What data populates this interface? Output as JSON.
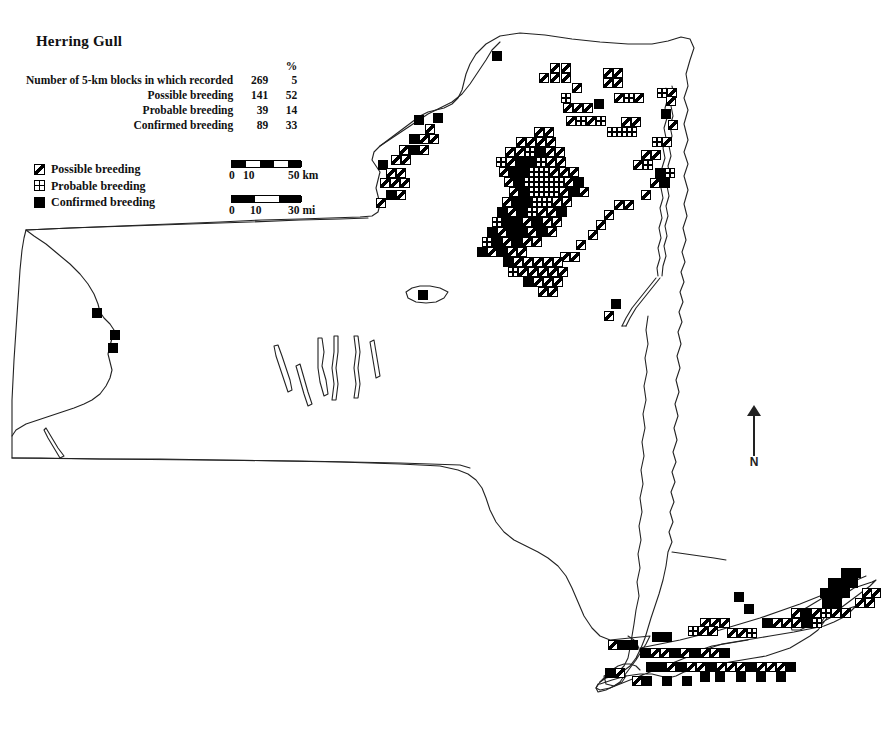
{
  "map": {
    "title": "Herring Gull",
    "region": "New York State",
    "stats": {
      "percent_header": "%",
      "rows": [
        {
          "label": "Number of 5-km blocks in which recorded",
          "count": "269",
          "percent": "5"
        },
        {
          "label": "Possible breeding",
          "count": "141",
          "percent": "52"
        },
        {
          "label": "Probable breeding",
          "count": "39",
          "percent": "14"
        },
        {
          "label": "Confirmed breeding",
          "count": "89",
          "percent": "33"
        }
      ]
    },
    "legend": [
      {
        "symbol": "possible-breeding-icon",
        "label": "Possible breeding"
      },
      {
        "symbol": "probable-breeding-icon",
        "label": "Probable breeding"
      },
      {
        "symbol": "confirmed-breeding-icon",
        "label": "Confirmed breeding"
      }
    ],
    "scales": [
      {
        "unit": "km",
        "start": "0",
        "mid": "10",
        "end": "50 km"
      },
      {
        "unit": "mi",
        "start": "0",
        "mid": "10",
        "end": "30 mi"
      }
    ],
    "compass": {
      "label": "N",
      "icon": "north-arrow-icon"
    },
    "colors": {
      "ink": "#000000",
      "paper": "#ffffff",
      "outline": "#222222"
    }
  },
  "chart_data": {
    "type": "map",
    "title": "Herring Gull",
    "subtitle": "Breeding distribution by 5-km block",
    "categories": [
      "Possible breeding",
      "Probable breeding",
      "Confirmed breeding"
    ],
    "values": [
      141,
      39,
      89
    ],
    "percents": [
      52,
      14,
      33
    ],
    "total_blocks_recorded": 269,
    "total_blocks_percent": 5,
    "legend_position": "upper-left",
    "grid": false,
    "block_size_px": 10,
    "symbols": {
      "possible": "square-with-diagonal",
      "probable": "square-with-cross",
      "confirmed": "solid-square"
    },
    "blocks": [
      [
        "c",
        492,
        51
      ],
      [
        "p",
        550,
        63
      ],
      [
        "p",
        561,
        63
      ],
      [
        "p",
        603,
        68
      ],
      [
        "p",
        613,
        68
      ],
      [
        "p",
        539,
        73
      ],
      [
        "p",
        550,
        73
      ],
      [
        "p",
        561,
        73
      ],
      [
        "p",
        603,
        78
      ],
      [
        "p",
        613,
        78
      ],
      [
        "r",
        657,
        88
      ],
      [
        "p",
        667,
        88
      ],
      [
        "p",
        572,
        83
      ],
      [
        "c",
        594,
        99
      ],
      [
        "p",
        666,
        96
      ],
      [
        "c",
        661,
        109
      ],
      [
        "p",
        668,
        120
      ],
      [
        "r",
        561,
        93
      ],
      [
        "p",
        614,
        93
      ],
      [
        "r",
        624,
        93
      ],
      [
        "p",
        634,
        93
      ],
      [
        "p",
        563,
        103
      ],
      [
        "p",
        573,
        103
      ],
      [
        "p",
        583,
        103
      ],
      [
        "p",
        621,
        117
      ],
      [
        "p",
        631,
        117
      ],
      [
        "p",
        566,
        116
      ],
      [
        "r",
        576,
        116
      ],
      [
        "p",
        586,
        116
      ],
      [
        "r",
        596,
        116
      ],
      [
        "p",
        534,
        127
      ],
      [
        "p",
        544,
        127
      ],
      [
        "r",
        607,
        127
      ],
      [
        "r",
        617,
        127
      ],
      [
        "r",
        627,
        127
      ],
      [
        "p",
        516,
        137
      ],
      [
        "p",
        526,
        137
      ],
      [
        "p",
        536,
        137
      ],
      [
        "p",
        546,
        137
      ],
      [
        "r",
        652,
        137
      ],
      [
        "p",
        662,
        137
      ],
      [
        "p",
        505,
        147
      ],
      [
        "p",
        515,
        147
      ],
      [
        "r",
        525,
        147
      ],
      [
        "c",
        535,
        147
      ],
      [
        "p",
        545,
        147
      ],
      [
        "p",
        555,
        147
      ],
      [
        "p",
        641,
        150
      ],
      [
        "p",
        651,
        150
      ],
      [
        "r",
        496,
        157
      ],
      [
        "p",
        506,
        157
      ],
      [
        "c",
        516,
        157
      ],
      [
        "c",
        526,
        157
      ],
      [
        "r",
        536,
        157
      ],
      [
        "p",
        546,
        157
      ],
      [
        "p",
        556,
        157
      ],
      [
        "p",
        633,
        160
      ],
      [
        "r",
        643,
        160
      ],
      [
        "p",
        499,
        167
      ],
      [
        "c",
        509,
        167
      ],
      [
        "c",
        519,
        167
      ],
      [
        "r",
        529,
        167
      ],
      [
        "r",
        539,
        167
      ],
      [
        "p",
        549,
        167
      ],
      [
        "p",
        559,
        167
      ],
      [
        "p",
        569,
        167
      ],
      [
        "c",
        655,
        168
      ],
      [
        "r",
        665,
        168
      ],
      [
        "p",
        504,
        177
      ],
      [
        "c",
        514,
        177
      ],
      [
        "r",
        524,
        177
      ],
      [
        "r",
        534,
        177
      ],
      [
        "r",
        544,
        177
      ],
      [
        "r",
        554,
        177
      ],
      [
        "p",
        564,
        177
      ],
      [
        "c",
        574,
        177
      ],
      [
        "p",
        650,
        178
      ],
      [
        "c",
        660,
        178
      ],
      [
        "p",
        509,
        187
      ],
      [
        "c",
        519,
        187
      ],
      [
        "r",
        529,
        187
      ],
      [
        "r",
        539,
        187
      ],
      [
        "r",
        549,
        187
      ],
      [
        "p",
        559,
        187
      ],
      [
        "c",
        569,
        187
      ],
      [
        "p",
        579,
        187
      ],
      [
        "p",
        641,
        190
      ],
      [
        "p",
        502,
        197
      ],
      [
        "c",
        512,
        197
      ],
      [
        "c",
        522,
        197
      ],
      [
        "r",
        532,
        197
      ],
      [
        "r",
        542,
        197
      ],
      [
        "p",
        552,
        197
      ],
      [
        "p",
        562,
        197
      ],
      [
        "p",
        614,
        200
      ],
      [
        "p",
        624,
        200
      ],
      [
        "c",
        497,
        207
      ],
      [
        "p",
        507,
        207
      ],
      [
        "c",
        517,
        207
      ],
      [
        "r",
        527,
        207
      ],
      [
        "p",
        537,
        207
      ],
      [
        "p",
        547,
        207
      ],
      [
        "c",
        557,
        207
      ],
      [
        "p",
        604,
        210
      ],
      [
        "r",
        492,
        217
      ],
      [
        "c",
        502,
        217
      ],
      [
        "c",
        512,
        217
      ],
      [
        "p",
        522,
        217
      ],
      [
        "c",
        532,
        217
      ],
      [
        "p",
        542,
        217
      ],
      [
        "p",
        552,
        217
      ],
      [
        "p",
        596,
        220
      ],
      [
        "c",
        487,
        227
      ],
      [
        "p",
        497,
        227
      ],
      [
        "c",
        507,
        227
      ],
      [
        "c",
        517,
        227
      ],
      [
        "p",
        527,
        227
      ],
      [
        "c",
        537,
        227
      ],
      [
        "p",
        547,
        227
      ],
      [
        "p",
        588,
        230
      ],
      [
        "r",
        482,
        237
      ],
      [
        "c",
        492,
        237
      ],
      [
        "p",
        502,
        237
      ],
      [
        "c",
        512,
        237
      ],
      [
        "p",
        522,
        237
      ],
      [
        "p",
        532,
        237
      ],
      [
        "p",
        576,
        240
      ],
      [
        "c",
        477,
        247
      ],
      [
        "p",
        487,
        247
      ],
      [
        "c",
        497,
        247
      ],
      [
        "p",
        507,
        247
      ],
      [
        "p",
        517,
        247
      ],
      [
        "p",
        560,
        252
      ],
      [
        "p",
        570,
        252
      ],
      [
        "c",
        503,
        257
      ],
      [
        "p",
        513,
        257
      ],
      [
        "p",
        523,
        257
      ],
      [
        "p",
        533,
        257
      ],
      [
        "p",
        543,
        257
      ],
      [
        "p",
        553,
        257
      ],
      [
        "r",
        508,
        267
      ],
      [
        "p",
        518,
        267
      ],
      [
        "p",
        528,
        267
      ],
      [
        "p",
        538,
        267
      ],
      [
        "p",
        548,
        267
      ],
      [
        "p",
        558,
        267
      ],
      [
        "c",
        523,
        277
      ],
      [
        "p",
        533,
        277
      ],
      [
        "p",
        543,
        277
      ],
      [
        "p",
        553,
        277
      ],
      [
        "p",
        538,
        287
      ],
      [
        "p",
        548,
        287
      ],
      [
        "c",
        611,
        299
      ],
      [
        "p",
        604,
        311
      ],
      [
        "c",
        414,
        115
      ],
      [
        "p",
        425,
        124
      ],
      [
        "c",
        433,
        113
      ],
      [
        "p",
        419,
        134
      ],
      [
        "c",
        409,
        134
      ],
      [
        "p",
        429,
        134
      ],
      [
        "p",
        399,
        145
      ],
      [
        "c",
        409,
        145
      ],
      [
        "p",
        419,
        145
      ],
      [
        "p",
        391,
        155
      ],
      [
        "p",
        401,
        155
      ],
      [
        "c",
        378,
        160
      ],
      [
        "p",
        386,
        168
      ],
      [
        "p",
        396,
        168
      ],
      [
        "p",
        380,
        178
      ],
      [
        "p",
        390,
        178
      ],
      [
        "p",
        400,
        178
      ],
      [
        "c",
        386,
        190
      ],
      [
        "p",
        396,
        190
      ],
      [
        "p",
        376,
        198
      ],
      [
        "c",
        418,
        290
      ],
      [
        "c",
        92,
        308
      ],
      [
        "c",
        110,
        330
      ],
      [
        "c",
        108,
        343
      ],
      [
        "c",
        841,
        568
      ],
      [
        "c",
        851,
        568
      ],
      [
        "c",
        828,
        578
      ],
      [
        "c",
        838,
        578
      ],
      [
        "c",
        848,
        578
      ],
      [
        "c",
        820,
        588
      ],
      [
        "c",
        830,
        588
      ],
      [
        "c",
        840,
        588
      ],
      [
        "p",
        862,
        588
      ],
      [
        "p",
        871,
        588
      ],
      [
        "c",
        734,
        592
      ],
      [
        "c",
        822,
        598
      ],
      [
        "c",
        832,
        598
      ],
      [
        "p",
        855,
        598
      ],
      [
        "p",
        865,
        598
      ],
      [
        "c",
        744,
        604
      ],
      [
        "p",
        791,
        608
      ],
      [
        "c",
        801,
        608
      ],
      [
        "p",
        811,
        608
      ],
      [
        "r",
        821,
        608
      ],
      [
        "p",
        831,
        608
      ],
      [
        "p",
        841,
        608
      ],
      [
        "p",
        700,
        618
      ],
      [
        "p",
        710,
        618
      ],
      [
        "p",
        720,
        618
      ],
      [
        "c",
        762,
        618
      ],
      [
        "p",
        772,
        618
      ],
      [
        "p",
        782,
        618
      ],
      [
        "p",
        792,
        618
      ],
      [
        "c",
        802,
        618
      ],
      [
        "r",
        812,
        618
      ],
      [
        "r",
        688,
        626
      ],
      [
        "p",
        698,
        626
      ],
      [
        "p",
        708,
        626
      ],
      [
        "c",
        652,
        632
      ],
      [
        "c",
        662,
        632
      ],
      [
        "p",
        727,
        628
      ],
      [
        "p",
        737,
        628
      ],
      [
        "r",
        747,
        628
      ],
      [
        "p",
        608,
        640
      ],
      [
        "c",
        618,
        640
      ],
      [
        "c",
        628,
        640
      ],
      [
        "c",
        640,
        648
      ],
      [
        "p",
        650,
        648
      ],
      [
        "p",
        660,
        648
      ],
      [
        "c",
        670,
        648
      ],
      [
        "p",
        680,
        648
      ],
      [
        "c",
        690,
        648
      ],
      [
        "p",
        700,
        648
      ],
      [
        "p",
        710,
        648
      ],
      [
        "c",
        720,
        648
      ],
      [
        "c",
        605,
        668
      ],
      [
        "p",
        615,
        668
      ],
      [
        "c",
        646,
        662
      ],
      [
        "c",
        656,
        662
      ],
      [
        "p",
        666,
        662
      ],
      [
        "c",
        676,
        662
      ],
      [
        "p",
        686,
        662
      ],
      [
        "p",
        696,
        662
      ],
      [
        "c",
        706,
        662
      ],
      [
        "p",
        716,
        662
      ],
      [
        "p",
        726,
        662
      ],
      [
        "p",
        736,
        662
      ],
      [
        "c",
        746,
        662
      ],
      [
        "p",
        756,
        662
      ],
      [
        "p",
        766,
        662
      ],
      [
        "p",
        776,
        662
      ],
      [
        "c",
        786,
        662
      ],
      [
        "c",
        700,
        672
      ],
      [
        "c",
        715,
        672
      ],
      [
        "c",
        736,
        672
      ],
      [
        "c",
        756,
        672
      ],
      [
        "c",
        776,
        672
      ],
      [
        "p",
        632,
        676
      ],
      [
        "c",
        642,
        676
      ],
      [
        "c",
        662,
        676
      ],
      [
        "c",
        682,
        676
      ]
    ]
  }
}
